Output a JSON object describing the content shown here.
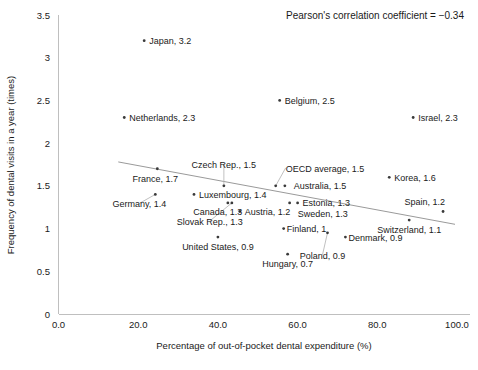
{
  "chart_data": {
    "type": "scatter",
    "title": "",
    "xlabel": "Percentage of out-of-pocket dental expenditure (%)",
    "ylabel": "Frequency of dental visits in a year (times)",
    "xlim": [
      0,
      100
    ],
    "ylim": [
      0,
      3.5
    ],
    "xticks": [
      "0.0",
      "20.0",
      "40.0",
      "60.0",
      "80.0",
      "100.0"
    ],
    "xtick_values": [
      0,
      20,
      40,
      60,
      80,
      100
    ],
    "yticks": [
      "0",
      "0.5",
      "1",
      "1.5",
      "2",
      "2.5",
      "3",
      "3.5"
    ],
    "ytick_values": [
      0,
      0.5,
      1,
      1.5,
      2,
      2.5,
      3,
      3.5
    ],
    "grid": false,
    "legend": "none",
    "annotation": "Pearson's correlation coefficient = −0.34",
    "annotation_value": -0.34,
    "trendline": {
      "x0": 15,
      "y0": 1.78,
      "x1": 99.5,
      "y1": 1.05
    },
    "points": [
      {
        "name": "Japan",
        "x": 21.5,
        "y": 3.2,
        "label": "Japan, 3.2",
        "label_dx": 5,
        "label_dy": 3.5,
        "anchor": "start"
      },
      {
        "name": "Belgium",
        "x": 55.5,
        "y": 2.5,
        "label": "Belgium, 2.5",
        "label_dx": 5,
        "label_dy": 3.5,
        "anchor": "start"
      },
      {
        "name": "Netherlands",
        "x": 16.5,
        "y": 2.3,
        "label": "Netherlands, 2.3",
        "label_dx": 5,
        "label_dy": 3.5,
        "anchor": "start"
      },
      {
        "name": "Israel",
        "x": 89.0,
        "y": 2.3,
        "label": "Israel, 2.3",
        "label_dx": 5,
        "label_dy": 3.5,
        "anchor": "start"
      },
      {
        "name": "France",
        "x": 24.8,
        "y": 1.7,
        "label": "France, 1.7",
        "label_dx": -2,
        "label_dy": 13,
        "anchor": "middle"
      },
      {
        "name": "Korea",
        "x": 83.0,
        "y": 1.6,
        "label": "Korea, 1.6",
        "label_dx": 5,
        "label_dy": 3.5,
        "anchor": "start"
      },
      {
        "name": "Czech Rep.",
        "x": 41.5,
        "y": 1.5,
        "label": "Czech Rep., 1.5",
        "label_dx": 0,
        "label_dy": -18,
        "anchor": "middle",
        "leader": true
      },
      {
        "name": "OECD average",
        "x": 54.5,
        "y": 1.5,
        "label": "OECD average, 1.5",
        "label_dx": 10,
        "label_dy": -14,
        "anchor": "start",
        "leader": true
      },
      {
        "name": "Australia",
        "x": 56.8,
        "y": 1.5,
        "label": "Australia, 1.5",
        "label_dx": 9,
        "label_dy": 3.5,
        "anchor": "start"
      },
      {
        "name": "Germany",
        "x": 24.3,
        "y": 1.4,
        "label": "Germany, 1.4",
        "label_dx": -16,
        "label_dy": 13,
        "anchor": "middle",
        "leader": true
      },
      {
        "name": "Luxembourg",
        "x": 34.0,
        "y": 1.4,
        "label": "Luxembourg, 1.4",
        "label_dx": 5,
        "label_dy": 3.5,
        "anchor": "start"
      },
      {
        "name": "Spain",
        "x": 96.5,
        "y": 1.2,
        "label": "Spain, 1.2",
        "label_dx": 2,
        "label_dy": -6,
        "anchor": "end"
      },
      {
        "name": "Canada",
        "x": 42.5,
        "y": 1.3,
        "label": "Canada, 1.3",
        "label_dx": -10,
        "label_dy": 12,
        "anchor": "middle"
      },
      {
        "name": "Austria",
        "x": 45.5,
        "y": 1.2,
        "label": "Austria, 1.2",
        "label_dx": 5,
        "label_dy": 3.5,
        "anchor": "start"
      },
      {
        "name": "Estonia",
        "x": 60.0,
        "y": 1.3,
        "label": "Estonia, 1.3",
        "label_dx": 5,
        "label_dy": 3.5,
        "anchor": "start"
      },
      {
        "name": "Sweden",
        "x": 58.0,
        "y": 1.3,
        "label": "Sweden, 1.3",
        "label_dx": 8,
        "label_dy": 14,
        "anchor": "start"
      },
      {
        "name": "Slovak Rep.",
        "x": 43.5,
        "y": 1.3,
        "label": "Slovak Rep., 1.3",
        "label_dx": -22,
        "label_dy": 22,
        "anchor": "middle",
        "leader": true
      },
      {
        "name": "Switzerland",
        "x": 88.0,
        "y": 1.1,
        "label": "Switzerland, 1.1",
        "label_dx": 0,
        "label_dy": 13,
        "anchor": "middle"
      },
      {
        "name": "Finland",
        "x": 56.5,
        "y": 1.0,
        "label": "Finland, 1",
        "label_dx": 3,
        "label_dy": 3.5,
        "anchor": "start"
      },
      {
        "name": "United States",
        "x": 40.0,
        "y": 0.9,
        "label": "United States, 0.9",
        "label_dx": 0,
        "label_dy": 13,
        "anchor": "middle"
      },
      {
        "name": "Denmark",
        "x": 72.0,
        "y": 0.9,
        "label": "Denmark, 0.9",
        "label_dx": 3,
        "label_dy": 3.5,
        "anchor": "start"
      },
      {
        "name": "Poland",
        "x": 67.5,
        "y": 0.95,
        "label": "Poland, 0.9",
        "label_dx": -5,
        "label_dy": 26,
        "anchor": "middle",
        "leader": true
      },
      {
        "name": "Hungary",
        "x": 57.5,
        "y": 0.7,
        "label": "Hungary, 0.7",
        "label_dx": 0,
        "label_dy": 13,
        "anchor": "middle"
      }
    ]
  }
}
